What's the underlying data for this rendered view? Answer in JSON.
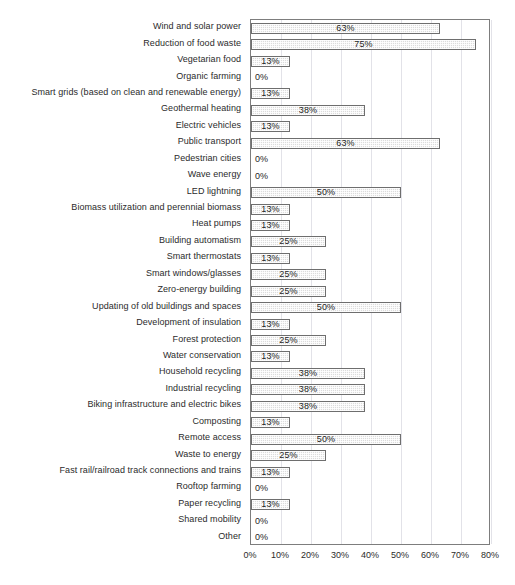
{
  "corner_note": "",
  "chart_data": {
    "type": "bar",
    "orientation": "horizontal",
    "title": "",
    "xlabel": "",
    "ylabel": "",
    "xlim": [
      0,
      80
    ],
    "grid": true,
    "legend": "none",
    "xticks": [
      "0%",
      "10%",
      "20%",
      "30%",
      "40%",
      "50%",
      "60%",
      "70%",
      "80%"
    ],
    "xtick_values": [
      0,
      10,
      20,
      30,
      40,
      50,
      60,
      70,
      80
    ],
    "categories": [
      "Wind and solar power",
      "Reduction of food waste",
      "Vegetarian food",
      "Organic farming",
      "Smart grids (based on clean and renewable energy)",
      "Geothermal heating",
      "Electric vehicles",
      "Public transport",
      "Pedestrian cities",
      "Wave energy",
      "LED lightning",
      "Biomass utilization and perennial biomass",
      "Heat pumps",
      "Building automatism",
      "Smart thermostats",
      "Smart windows/glasses",
      "Zero-energy building",
      "Updating of old buildings and spaces",
      "Development of insulation",
      "Forest protection",
      "Water conservation",
      "Household recycling",
      "Industrial recycling",
      "Biking infrastructure and electric bikes",
      "Composting",
      "Remote access",
      "Waste to energy",
      "Fast rail/railroad track connections and trains",
      "Rooftop farming",
      "Paper recycling",
      "Shared mobility",
      "Other"
    ],
    "values": [
      63,
      75,
      13,
      0,
      13,
      38,
      13,
      63,
      0,
      0,
      50,
      13,
      13,
      25,
      13,
      25,
      25,
      50,
      13,
      25,
      13,
      38,
      38,
      38,
      13,
      50,
      25,
      13,
      0,
      13,
      0,
      0
    ],
    "data_labels": [
      "63%",
      "75%",
      "13%",
      "0%",
      "13%",
      "38%",
      "13%",
      "63%",
      "0%",
      "0%",
      "50%",
      "13%",
      "13%",
      "25%",
      "13%",
      "25%",
      "25%",
      "50%",
      "13%",
      "25%",
      "13%",
      "38%",
      "38%",
      "38%",
      "13%",
      "50%",
      "25%",
      "13%",
      "0%",
      "13%",
      "0%",
      "0%"
    ],
    "colors": {
      "bar_fill": "#dcdcdc",
      "bar_border": "#6e6e6e",
      "gridline": "#e2e2e8",
      "axis": "#7d7d7d",
      "text": "#2b2b2b"
    }
  }
}
